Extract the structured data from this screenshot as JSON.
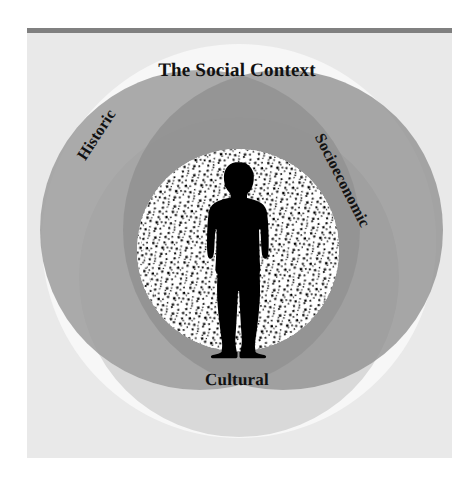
{
  "figure": {
    "title": "The Social Context",
    "domains": [
      {
        "id": "historic",
        "label": "Historic",
        "position": "upper-left",
        "color": "#9a9a9a"
      },
      {
        "id": "socioeconomic",
        "label": "Socioeconomic",
        "position": "upper-right",
        "color": "#9a9a9a"
      },
      {
        "id": "cultural",
        "label": "Cultural",
        "position": "lower-center",
        "color": "#d2d2d2"
      }
    ],
    "center_element": {
      "name": "person-silhouette",
      "description": "Black silhouette of a standing person"
    },
    "colors": {
      "page_background": "#ffffff",
      "panel_background": "#e9e9e9",
      "top_rule": "#808080",
      "outer_halo": "#f7f7f7",
      "circle_gray": "#9a9a9a",
      "circle_overlap_dark": "#8b8b8b",
      "circle_light_gray": "#d2d2d2",
      "stipple_field": "#ffffff",
      "stipple_dots": "#000000",
      "silhouette": "#000000",
      "label_text": "#111111"
    }
  }
}
